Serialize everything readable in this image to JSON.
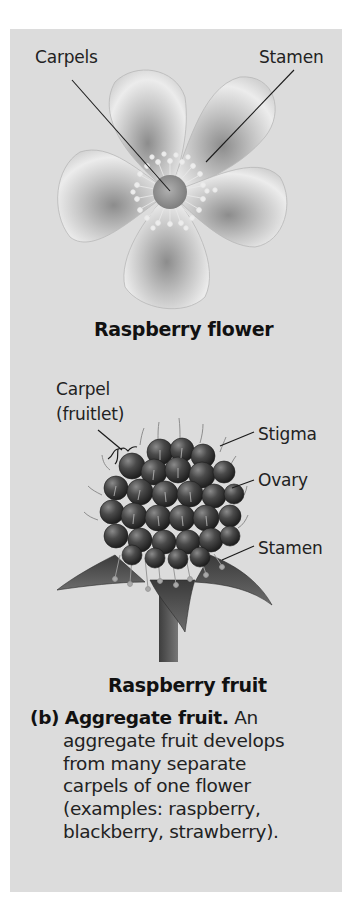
{
  "flower": {
    "caption": "Raspberry flower",
    "labels": {
      "carpels": "Carpels",
      "stamen": "Stamen"
    }
  },
  "fruit": {
    "caption": "Raspberry fruit",
    "labels": {
      "carpel_line1": "Carpel",
      "carpel_line2": "(fruitlet)",
      "stigma": "Stigma",
      "ovary": "Ovary",
      "stamen": "Stamen"
    }
  },
  "description": {
    "tag": "(b)",
    "term": "Aggregate fruit.",
    "lines": [
      " An",
      "aggregate fruit develops",
      "from many separate",
      "carpels of one flower",
      "(examples: raspberry,",
      "blackberry, strawberry)."
    ]
  },
  "colors": {
    "panel_background": "#dcdcdc",
    "text": "#222222",
    "leader_line": "#1a1a1a"
  }
}
